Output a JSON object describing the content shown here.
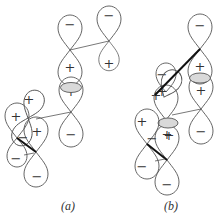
{
  "figure": {
    "panels": [
      {
        "id": "a",
        "caption": "(a)",
        "orbitals": [
          {
            "name": "top-right-p-orbital",
            "upper_sign": "−",
            "lower_sign": "+"
          },
          {
            "name": "central-upper-p-orbital",
            "upper_sign": "−",
            "lower_sign": "+"
          },
          {
            "name": "central-lower-p-orbital",
            "upper_sign": "+",
            "lower_sign": "−"
          },
          {
            "name": "left-p-orbital-1",
            "upper_sign": "+",
            "lower_sign": "−"
          },
          {
            "name": "left-p-orbital-2",
            "upper_sign": "+",
            "lower_sign": "−"
          },
          {
            "name": "left-p-orbital-3",
            "upper_sign": "+",
            "lower_sign": "−"
          }
        ],
        "overlap_shaded": true
      },
      {
        "id": "b",
        "caption": "(b)",
        "orbitals": [
          {
            "name": "top-right-p-orbital",
            "upper_sign": "−",
            "lower_sign": "+"
          },
          {
            "name": "right-lower-p-orbital",
            "upper_sign": "+",
            "lower_sign": "−"
          },
          {
            "name": "central-p-orbital",
            "upper_sign": "−",
            "lower_sign": "+"
          },
          {
            "name": "central-lower-p-orbital",
            "upper_sign": "+",
            "lower_sign": "−"
          },
          {
            "name": "left-p-orbital-1",
            "upper_sign": "+",
            "lower_sign": "−"
          },
          {
            "name": "left-p-orbital-2",
            "upper_sign": "+",
            "lower_sign": "−"
          }
        ],
        "overlap_shaded": true
      }
    ],
    "signs": {
      "plus": "+",
      "minus": "−"
    }
  }
}
